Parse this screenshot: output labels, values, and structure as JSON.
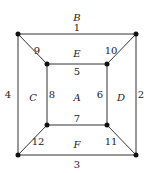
{
  "diagram": {
    "vertices": [
      {
        "id": "o1",
        "x": 18,
        "y": 34
      },
      {
        "id": "o2",
        "x": 136,
        "y": 34
      },
      {
        "id": "o3",
        "x": 136,
        "y": 155
      },
      {
        "id": "o4",
        "x": 18,
        "y": 155
      },
      {
        "id": "i1",
        "x": 47,
        "y": 64
      },
      {
        "id": "i2",
        "x": 107,
        "y": 64
      },
      {
        "id": "i3",
        "x": 107,
        "y": 125
      },
      {
        "id": "i4",
        "x": 47,
        "y": 125
      }
    ],
    "edges": [
      {
        "label": "1",
        "from": "o1",
        "to": "o2",
        "lx": 77,
        "ly": 31
      },
      {
        "label": "2",
        "from": "o2",
        "to": "o3",
        "lx": 141,
        "ly": 98
      },
      {
        "label": "3",
        "from": "o4",
        "to": "o3",
        "lx": 77,
        "ly": 168
      },
      {
        "label": "4",
        "from": "o1",
        "to": "o4",
        "lx": 8,
        "ly": 98
      },
      {
        "label": "5",
        "from": "i1",
        "to": "i2",
        "lx": 77,
        "ly": 75
      },
      {
        "label": "6",
        "from": "i2",
        "to": "i3",
        "lx": 100,
        "ly": 98
      },
      {
        "label": "7",
        "from": "i4",
        "to": "i3",
        "lx": 77,
        "ly": 122
      },
      {
        "label": "8",
        "from": "i1",
        "to": "i4",
        "lx": 52,
        "ly": 98
      },
      {
        "label": "9",
        "from": "o1",
        "to": "i1",
        "lx": 37,
        "ly": 54
      },
      {
        "label": "10",
        "from": "o2",
        "to": "i2",
        "lx": 111,
        "ly": 54
      },
      {
        "label": "11",
        "from": "i3",
        "to": "o3",
        "lx": 111,
        "ly": 145
      },
      {
        "label": "12",
        "from": "i4",
        "to": "o4",
        "lx": 38,
        "ly": 145
      }
    ],
    "faces": [
      {
        "label": "A",
        "x": 77,
        "y": 98
      },
      {
        "label": "B",
        "x": 77,
        "y": 18
      },
      {
        "label": "C",
        "x": 33,
        "y": 98
      },
      {
        "label": "D",
        "x": 121,
        "y": 98
      },
      {
        "label": "E",
        "x": 77,
        "y": 54
      },
      {
        "label": "F",
        "x": 77,
        "y": 145
      }
    ]
  }
}
